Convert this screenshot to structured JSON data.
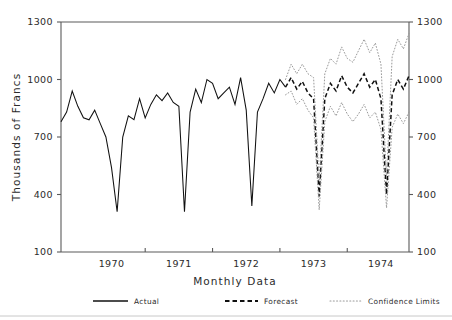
{
  "chart_data": {
    "type": "line",
    "title": "",
    "xlabel": "Monthly Data",
    "ylabel": "Thousands of Francs",
    "ylim": [
      100,
      1300
    ],
    "yticks": [
      100,
      400,
      700,
      1000,
      1300
    ],
    "ytick_labels": [
      "100",
      "400",
      "700",
      "1000",
      "1300"
    ],
    "right_axis_labels": [
      "100",
      "400",
      "700",
      "1000",
      "1300"
    ],
    "xtick_labels": [
      "1970",
      "1971",
      "1972",
      "1973",
      "1974"
    ],
    "x_minor_ticks": true,
    "grid": false,
    "legend_position": "bottom",
    "x_start_label": "1969-10",
    "x_end_label": "1974-12",
    "series": [
      {
        "name": "Actual",
        "style": "solid",
        "color": "#101010",
        "x": [
          "1969-10",
          "1969-11",
          "1969-12",
          "1970-01",
          "1970-02",
          "1970-03",
          "1970-04",
          "1970-05",
          "1970-06",
          "1970-07",
          "1970-08",
          "1970-09",
          "1970-10",
          "1970-11",
          "1970-12",
          "1971-01",
          "1971-02",
          "1971-03",
          "1971-04",
          "1971-05",
          "1971-06",
          "1971-07",
          "1971-08",
          "1971-09",
          "1971-10",
          "1971-11",
          "1971-12",
          "1972-01",
          "1972-02",
          "1972-03",
          "1972-04",
          "1972-05",
          "1972-06",
          "1972-07",
          "1972-08",
          "1972-09",
          "1972-10",
          "1972-11",
          "1972-12",
          "1973-01",
          "1973-02"
        ],
        "values": [
          780,
          830,
          940,
          860,
          800,
          790,
          840,
          770,
          700,
          540,
          310,
          700,
          810,
          790,
          900,
          800,
          870,
          920,
          890,
          930,
          880,
          860,
          310,
          830,
          950,
          880,
          1000,
          980,
          900,
          930,
          960,
          870,
          1010,
          840,
          340,
          830,
          900,
          980,
          930,
          1000,
          960
        ]
      },
      {
        "name": "Forecast",
        "style": "dashed",
        "color": "#101010",
        "x": [
          "1973-02",
          "1973-03",
          "1973-04",
          "1973-05",
          "1973-06",
          "1973-07",
          "1973-08",
          "1973-09",
          "1973-10",
          "1973-11",
          "1973-12",
          "1974-01",
          "1974-02",
          "1974-03",
          "1974-04",
          "1974-05",
          "1974-06",
          "1974-07",
          "1974-08",
          "1974-09",
          "1974-10",
          "1974-11",
          "1974-12"
        ],
        "values": [
          960,
          1010,
          950,
          990,
          930,
          900,
          390,
          900,
          980,
          940,
          1020,
          960,
          930,
          980,
          1030,
          960,
          1000,
          900,
          400,
          920,
          1000,
          950,
          1020
        ]
      },
      {
        "name": "Confidence Limits Upper",
        "style": "dotted",
        "color": "#9a9a9a",
        "x": [
          "1973-02",
          "1973-03",
          "1973-04",
          "1973-05",
          "1973-06",
          "1973-07",
          "1973-08",
          "1973-09",
          "1973-10",
          "1973-11",
          "1973-12",
          "1974-01",
          "1974-02",
          "1974-03",
          "1974-04",
          "1974-05",
          "1974-06",
          "1974-07",
          "1974-08",
          "1974-09",
          "1974-10",
          "1974-11",
          "1974-12"
        ],
        "values": [
          1000,
          1080,
          1030,
          1080,
          1030,
          1010,
          470,
          1030,
          1110,
          1080,
          1170,
          1110,
          1090,
          1150,
          1210,
          1140,
          1190,
          1080,
          490,
          1120,
          1210,
          1160,
          1240
        ]
      },
      {
        "name": "Confidence Limits Lower",
        "style": "dotted",
        "color": "#9a9a9a",
        "x": [
          "1973-02",
          "1973-03",
          "1973-04",
          "1973-05",
          "1973-06",
          "1973-07",
          "1973-08",
          "1973-09",
          "1973-10",
          "1973-11",
          "1973-12",
          "1974-01",
          "1974-02",
          "1974-03",
          "1974-04",
          "1974-05",
          "1974-06",
          "1974-07",
          "1974-08",
          "1974-09",
          "1974-10",
          "1974-11",
          "1974-12"
        ],
        "values": [
          920,
          940,
          870,
          900,
          840,
          800,
          320,
          780,
          860,
          810,
          880,
          820,
          780,
          820,
          870,
          800,
          830,
          740,
          330,
          750,
          820,
          770,
          830
        ]
      }
    ]
  },
  "legend": {
    "items": [
      {
        "label": "Actual",
        "style": "solid"
      },
      {
        "label": "Forecast",
        "style": "dashed"
      },
      {
        "label": "Confidence Limits",
        "style": "dotted"
      }
    ]
  },
  "axes": {
    "y_title": "Thousands of Francs",
    "x_title": "Monthly Data"
  }
}
